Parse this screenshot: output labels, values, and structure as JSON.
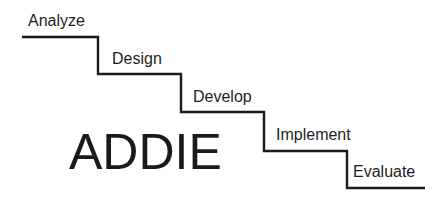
{
  "diagram": {
    "title": "ADDIE",
    "steps": [
      {
        "label": "Analyze"
      },
      {
        "label": "Design"
      },
      {
        "label": "Develop"
      },
      {
        "label": "Implement"
      },
      {
        "label": "Evaluate"
      }
    ],
    "line_color": "#1a1a1a"
  }
}
